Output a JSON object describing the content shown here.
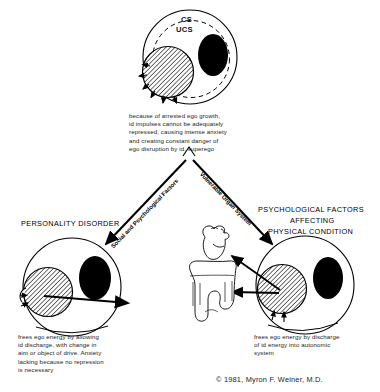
{
  "figure": {
    "title_hidden": "",
    "top_node": {
      "name": "psychic-apparatus-top",
      "label_cs": "CS",
      "label_ucs": "UCS"
    },
    "top_caption": "because of arrested ego growth,\nid impulses cannot be adequately\nrepressed, causing intense anxiety\nand creating constant danger of\nego disruption by id, superego",
    "left_branch_label": "Social and Psychological Factors",
    "right_branch_label": "Vulnerable Organ System",
    "left_outcome_title": "PERSONALITY DISORDER",
    "right_outcome_title_line1": "PSYCHOLOGICAL FACTORS",
    "right_outcome_title_line2": "AFFECTING",
    "right_outcome_title_line3": "PHYSICAL CONDITION",
    "left_caption": "frees ego energy by allowing\nid discharge, with change in\naim or object of drive. Anxiety\nlacking because no repression\nis necessary",
    "right_caption": "frees ego energy by discharge\nof id energy into autonomic\nsystem",
    "copyright": "© 1981, Myron F. Weiner, M.D.",
    "organs": {
      "heart_icon": "heart-organ-icon",
      "colon_icon": "colon-organ-icon"
    },
    "colors": {
      "ink": "#000000",
      "paper": "#ffffff",
      "hatch": "#222222",
      "solid_blob": "#000000"
    }
  }
}
